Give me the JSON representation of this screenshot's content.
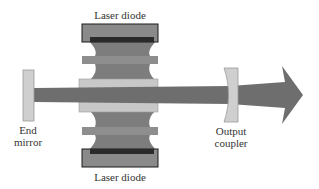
{
  "diagram": {
    "type": "laser-cavity-schematic",
    "labels": {
      "top_diode": "Laser diode",
      "bottom_diode": "Laser diode",
      "end_mirror_line1": "End",
      "end_mirror_line2": "mirror",
      "output_coupler_line1": "Output",
      "output_coupler_line2": "coupler"
    },
    "colors": {
      "beam": "#6e6e6e",
      "crystal": "#c8c8c8",
      "pump": "#7d7d7d",
      "pump_band": "#8e8e8e",
      "diode_body": "#8a8a8a",
      "diode_strip": "#2a2a2a",
      "mirror": "#cfcfcf",
      "outline": "#1a1a1a"
    }
  }
}
